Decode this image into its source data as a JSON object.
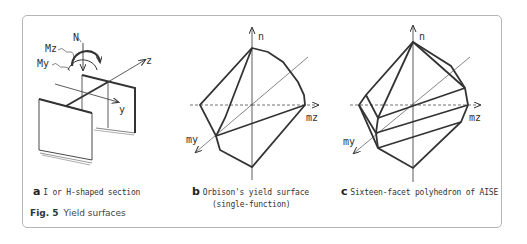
{
  "figure": {
    "number": "Fig. 5",
    "title": "Yield surfaces"
  },
  "panels": [
    {
      "letter": "a",
      "caption": "I or H-shaped section",
      "labels": {
        "N": "N",
        "Mz": "Mz",
        "My": "My",
        "z": "z",
        "y": "y"
      }
    },
    {
      "letter": "b",
      "caption_line1": "Orbison's yield surface",
      "caption_line2": "(single-function)",
      "labels": {
        "n": "n",
        "mz": "mz",
        "my": "my"
      }
    },
    {
      "letter": "c",
      "caption": "Sixteen-facet polyhedron of AISE",
      "labels": {
        "n": "n",
        "mz": "mz",
        "my": "my"
      }
    }
  ]
}
